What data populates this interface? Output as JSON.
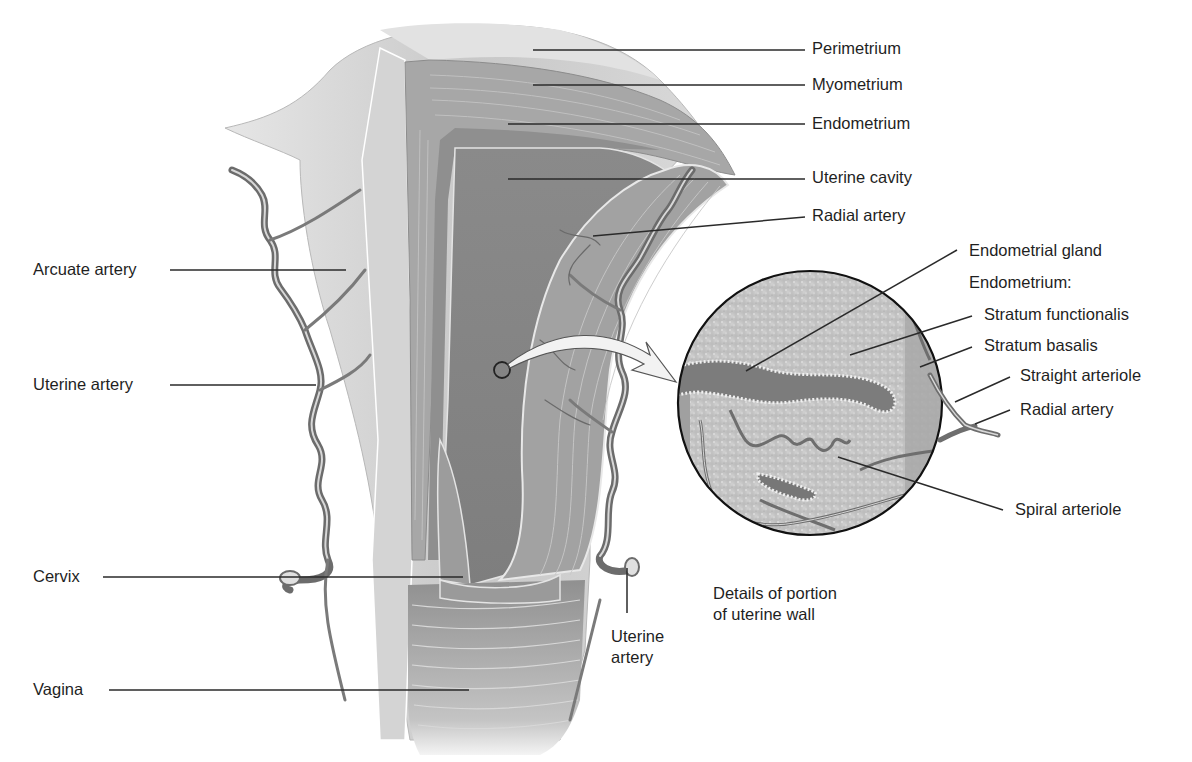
{
  "diagram": {
    "colors": {
      "background": "#ffffff",
      "leader_line": "#2a2a2a",
      "perimetrium": "#cfcfcf",
      "myometrium": "#a9a9a9",
      "endometrium": "#8e8e8e",
      "cavity": "#8a8a8a",
      "artery": "#6e6e6e",
      "artery_highlight": "#d8d8d8",
      "detail_circle_fill": "#c9c9c9",
      "gland": "#777777"
    },
    "labels_right": [
      {
        "id": "perimetrium",
        "text": "Perimetrium"
      },
      {
        "id": "myometrium",
        "text": "Myometrium"
      },
      {
        "id": "endometrium",
        "text": "Endometrium"
      },
      {
        "id": "uterine-cavity",
        "text": "Uterine cavity"
      },
      {
        "id": "radial-artery",
        "text": "Radial artery"
      }
    ],
    "labels_left": [
      {
        "id": "arcuate-artery",
        "text": "Arcuate artery"
      },
      {
        "id": "uterine-artery-left",
        "text": "Uterine artery"
      },
      {
        "id": "cervix",
        "text": "Cervix"
      },
      {
        "id": "vagina",
        "text": "Vagina"
      }
    ],
    "labels_detail": [
      {
        "id": "endometrial-gland",
        "text": "Endometrial gland"
      },
      {
        "id": "endometrium-heading",
        "text": "Endometrium:"
      },
      {
        "id": "stratum-functionalis",
        "text": "Stratum functionalis"
      },
      {
        "id": "stratum-basalis",
        "text": "Stratum basalis"
      },
      {
        "id": "straight-arteriole",
        "text": "Straight arteriole"
      },
      {
        "id": "radial-artery-detail",
        "text": "Radial artery"
      },
      {
        "id": "spiral-arteriole",
        "text": "Spiral arteriole"
      }
    ],
    "label_uterine_artery_bottom": "Uterine\nartery",
    "caption": "Details of portion\nof uterine wall"
  }
}
